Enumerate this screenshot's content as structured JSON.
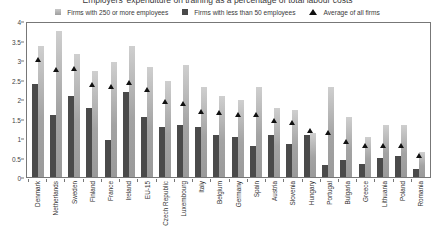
{
  "chart_data": {
    "type": "bar",
    "title": "Employers' expenditure on training as a percentage of total labour costs",
    "xlabel": "",
    "ylabel": "",
    "ylim": [
      0,
      4
    ],
    "yticks": [
      "0",
      "0.5",
      "1",
      "1.5",
      "2",
      "2.5",
      "3",
      "3.5",
      "4"
    ],
    "grid": false,
    "legend_position": "top-center",
    "categories": [
      "Denmark",
      "Netherlands",
      "Sweden",
      "Finland",
      "France",
      "Ireland",
      "EU-15",
      "Czech Republic",
      "Luxembourg",
      "Italy",
      "Belgium",
      "Germany",
      "Spain",
      "Austria",
      "Slovenia",
      "Hungary",
      "Portugal",
      "Bulgaria",
      "Greece",
      "Lithuania",
      "Poland",
      "Romania"
    ],
    "series": [
      {
        "name": "Firms with 250 or more employees",
        "kind": "bar",
        "color": "#a3a3a3",
        "values": [
          3.4,
          3.8,
          3.2,
          2.75,
          3.0,
          3.4,
          2.85,
          2.5,
          2.9,
          2.35,
          2.1,
          2.0,
          2.35,
          1.8,
          1.75,
          1.15,
          2.35,
          1.55,
          1.05,
          1.35,
          1.35,
          0.65
        ]
      },
      {
        "name": "Firms with less than 50 employees",
        "kind": "bar",
        "color": "#4a4a4a",
        "values": [
          2.42,
          1.62,
          2.1,
          1.8,
          0.97,
          2.2,
          1.55,
          1.3,
          1.35,
          1.3,
          1.1,
          1.05,
          0.8,
          1.1,
          0.85,
          1.1,
          0.3,
          0.45,
          0.35,
          0.5,
          0.55,
          0.2
        ]
      },
      {
        "name": "Average of all firms",
        "kind": "marker",
        "color": "#111111",
        "values": [
          3.05,
          2.78,
          2.8,
          2.4,
          2.35,
          2.45,
          2.25,
          1.95,
          1.9,
          1.7,
          1.65,
          1.6,
          1.6,
          1.45,
          1.4,
          1.2,
          1.15,
          0.9,
          0.8,
          0.8,
          0.8,
          0.55
        ]
      }
    ]
  },
  "legend": {
    "items": [
      {
        "label": "Firms with 250 or more employees",
        "marker": "square-light-icon"
      },
      {
        "label": "Firms with less than 50 employees",
        "marker": "square-dark-icon"
      },
      {
        "label": "Average of all firms",
        "marker": "triangle-icon"
      }
    ]
  }
}
